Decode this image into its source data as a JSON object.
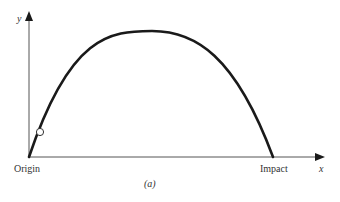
{
  "diagram": {
    "type": "projectile-trajectory",
    "caption": "(a)",
    "axes": {
      "x_label": "x",
      "y_label": "y"
    },
    "points": {
      "origin_label": "Origin",
      "impact_label": "Impact"
    },
    "colors": {
      "axis": "#555555",
      "curve": "#1a1a1a",
      "text": "#333333",
      "marker_fill": "#ffffff"
    }
  }
}
